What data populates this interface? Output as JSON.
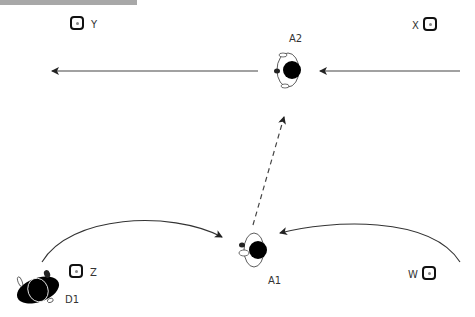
{
  "diagram": {
    "players": [
      {
        "id": "A2",
        "label": "A2"
      },
      {
        "id": "A1",
        "label": "A1"
      },
      {
        "id": "D1",
        "label": "D1"
      }
    ],
    "cones": [
      {
        "id": "Y",
        "label": "Y"
      },
      {
        "id": "X",
        "label": "X"
      },
      {
        "id": "Z",
        "label": "Z"
      },
      {
        "id": "W",
        "label": "W"
      }
    ],
    "arrows": [
      {
        "type": "solid",
        "from": "A2",
        "to": "left-edge"
      },
      {
        "type": "solid",
        "from": "right-edge",
        "to": "A2"
      },
      {
        "type": "dashed",
        "from": "A1",
        "to": "A2"
      },
      {
        "type": "curved",
        "from": "D1",
        "to": "A1"
      },
      {
        "type": "curved",
        "from": "W",
        "to": "A1"
      }
    ],
    "colors": {
      "line": "#222222",
      "cone": "#111111",
      "player": "#000000",
      "bar": "#a8a8a8"
    }
  }
}
